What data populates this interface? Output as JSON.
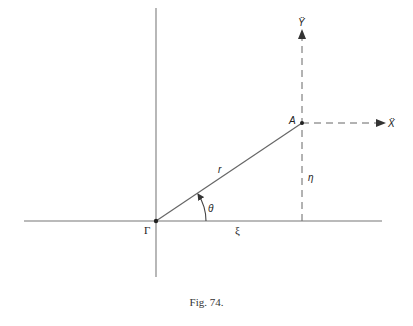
{
  "figure": {
    "caption": "Fig. 74.",
    "labels": {
      "origin": "Γ",
      "point": "A",
      "radius": "r",
      "angle": "θ",
      "x_coord": "ξ",
      "y_coord": "η",
      "x_accel": "Ẍ",
      "y_accel": "Ÿ"
    },
    "colors": {
      "line": "#555555",
      "text": "#222222"
    }
  }
}
